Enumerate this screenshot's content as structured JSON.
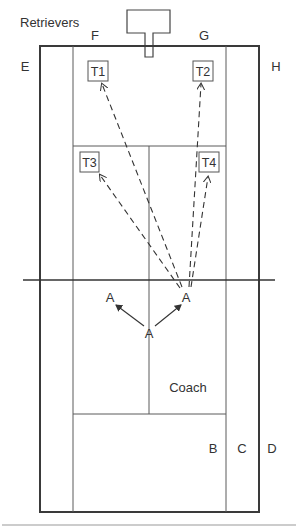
{
  "diagram": {
    "labels": {
      "retrievers": "Retrievers",
      "E": "E",
      "F": "F",
      "G": "G",
      "H": "H",
      "B": "B",
      "C": "C",
      "D": "D",
      "coach": "Coach"
    },
    "targets": [
      {
        "id": "T1",
        "label": "T1",
        "x": 88,
        "y": 61,
        "w": 20,
        "h": 20
      },
      {
        "id": "T2",
        "label": "T2",
        "x": 193,
        "y": 61,
        "w": 20,
        "h": 20
      },
      {
        "id": "T3",
        "label": "T3",
        "x": 80,
        "y": 152,
        "w": 19,
        "h": 20
      },
      {
        "id": "T4",
        "label": "T4",
        "x": 199,
        "y": 152,
        "w": 20,
        "h": 20
      }
    ],
    "players": [
      {
        "id": "A-left",
        "label": "A",
        "x": 110,
        "y": 302
      },
      {
        "id": "A-right",
        "label": "A",
        "x": 186,
        "y": 302
      },
      {
        "id": "A-center",
        "label": "A",
        "x": 149,
        "y": 338
      }
    ],
    "colors": {
      "line": "#3a3a3a",
      "background": "#ffffff"
    }
  }
}
